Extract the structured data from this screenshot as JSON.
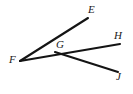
{
  "figure": {
    "type": "geometry-diagram",
    "background_color": "#ffffff",
    "stroke_color": "#141414",
    "label_color": "#191919",
    "width": 133,
    "height": 94,
    "points": [
      {
        "id": "E",
        "label": "E",
        "x": 88,
        "y": 18
      },
      {
        "id": "H",
        "label": "H",
        "x": 120,
        "y": 44
      },
      {
        "id": "G",
        "label": "G",
        "x": 60,
        "y": 55
      },
      {
        "id": "F",
        "label": "F",
        "x": 20,
        "y": 61
      },
      {
        "id": "J",
        "label": "J",
        "x": 118,
        "y": 72
      }
    ],
    "segments": [
      {
        "id": "FE",
        "name": "ray-f-to-e",
        "from": "F",
        "to": "E",
        "x1": 20,
        "y1": 61,
        "x2": 88,
        "y2": 18
      },
      {
        "id": "FH",
        "name": "ray-f-through-g-to-h",
        "from": "F",
        "to": "H",
        "x1": 20,
        "y1": 61,
        "x2": 120,
        "y2": 44
      },
      {
        "id": "GJ",
        "name": "ray-g-to-j",
        "from": "G",
        "to": "J",
        "x1": 55,
        "y1": 52,
        "x2": 118,
        "y2": 72
      }
    ]
  }
}
